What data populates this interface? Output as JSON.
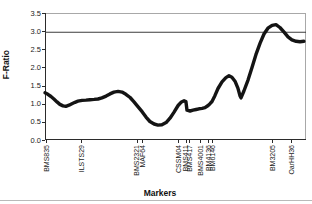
{
  "chart_data": {
    "type": "line",
    "title": "",
    "xlabel": "Markers",
    "ylabel": "F-Ratio",
    "ylim": [
      0.0,
      3.5
    ],
    "ytick_step": 0.5,
    "yticks": [
      "0.0",
      "0.5",
      "1.0",
      "1.5",
      "2.0",
      "2.5",
      "3.0",
      "3.5"
    ],
    "grid": false,
    "legend": "none",
    "threshold_line": {
      "value": 2.97,
      "color": "#3c3c3c"
    },
    "line_color": "#141414",
    "frame_color": "#a8a8a8",
    "axis_color": "#2b2b2b",
    "markers": [
      {
        "label": "BMS835",
        "pos": 0.004
      },
      {
        "label": "ILSTS29",
        "pos": 0.138
      },
      {
        "label": "BMS2321",
        "pos": 0.352
      },
      {
        "label": "MAF64",
        "pos": 0.372
      },
      {
        "label": "CSSM04",
        "pos": 0.51
      },
      {
        "label": "BMS411",
        "pos": 0.54
      },
      {
        "label": "BMS417",
        "pos": 0.552
      },
      {
        "label": "BMS4001",
        "pos": 0.594
      },
      {
        "label": "BM4136",
        "pos": 0.625
      },
      {
        "label": "BM6146",
        "pos": 0.64
      },
      {
        "label": "BM3205",
        "pos": 0.87
      },
      {
        "label": "OarHH36",
        "pos": 0.943
      }
    ],
    "series": [
      {
        "name": "F-Ratio",
        "points": [
          [
            0.0,
            1.3
          ],
          [
            0.011,
            1.26
          ],
          [
            0.023,
            1.2
          ],
          [
            0.034,
            1.13
          ],
          [
            0.046,
            1.05
          ],
          [
            0.057,
            0.98
          ],
          [
            0.069,
            0.94
          ],
          [
            0.08,
            0.93
          ],
          [
            0.092,
            0.96
          ],
          [
            0.103,
            1.0
          ],
          [
            0.115,
            1.04
          ],
          [
            0.126,
            1.07
          ],
          [
            0.142,
            1.09
          ],
          [
            0.157,
            1.1
          ],
          [
            0.172,
            1.11
          ],
          [
            0.188,
            1.12
          ],
          [
            0.203,
            1.13
          ],
          [
            0.218,
            1.16
          ],
          [
            0.234,
            1.21
          ],
          [
            0.249,
            1.27
          ],
          [
            0.264,
            1.32
          ],
          [
            0.28,
            1.34
          ],
          [
            0.295,
            1.32
          ],
          [
            0.31,
            1.26
          ],
          [
            0.326,
            1.17
          ],
          [
            0.341,
            1.05
          ],
          [
            0.356,
            0.92
          ],
          [
            0.372,
            0.78
          ],
          [
            0.387,
            0.63
          ],
          [
            0.402,
            0.51
          ],
          [
            0.418,
            0.44
          ],
          [
            0.433,
            0.41
          ],
          [
            0.448,
            0.42
          ],
          [
            0.464,
            0.48
          ],
          [
            0.479,
            0.6
          ],
          [
            0.494,
            0.76
          ],
          [
            0.51,
            0.95
          ],
          [
            0.521,
            1.04
          ],
          [
            0.533,
            1.08
          ],
          [
            0.54,
            1.06
          ],
          [
            0.544,
            0.82
          ],
          [
            0.556,
            0.8
          ],
          [
            0.567,
            0.82
          ],
          [
            0.579,
            0.84
          ],
          [
            0.59,
            0.86
          ],
          [
            0.602,
            0.87
          ],
          [
            0.613,
            0.89
          ],
          [
            0.625,
            0.95
          ],
          [
            0.632,
            1.0
          ],
          [
            0.64,
            1.06
          ],
          [
            0.651,
            1.22
          ],
          [
            0.663,
            1.42
          ],
          [
            0.678,
            1.6
          ],
          [
            0.693,
            1.72
          ],
          [
            0.705,
            1.77
          ],
          [
            0.716,
            1.73
          ],
          [
            0.728,
            1.62
          ],
          [
            0.739,
            1.43
          ],
          [
            0.747,
            1.22
          ],
          [
            0.751,
            1.16
          ],
          [
            0.762,
            1.35
          ],
          [
            0.778,
            1.66
          ],
          [
            0.793,
            2.0
          ],
          [
            0.808,
            2.35
          ],
          [
            0.824,
            2.67
          ],
          [
            0.839,
            2.92
          ],
          [
            0.854,
            3.08
          ],
          [
            0.87,
            3.16
          ],
          [
            0.885,
            3.18
          ],
          [
            0.9,
            3.1
          ],
          [
            0.916,
            2.97
          ],
          [
            0.931,
            2.84
          ],
          [
            0.946,
            2.76
          ],
          [
            0.962,
            2.72
          ],
          [
            0.977,
            2.71
          ],
          [
            0.992,
            2.72
          ]
        ]
      }
    ]
  }
}
